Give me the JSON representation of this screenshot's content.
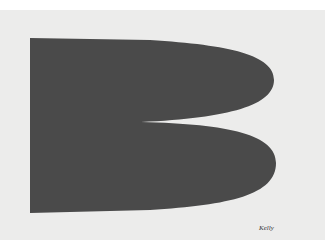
{
  "artwork": {
    "description": "Dark gray abstract shape resembling a letter B with two rounded lobes on light paper",
    "signature": "Kelly",
    "colors": {
      "shape": "#4a4a4a",
      "paper": "#ececeb",
      "border": "#ffffff"
    }
  }
}
